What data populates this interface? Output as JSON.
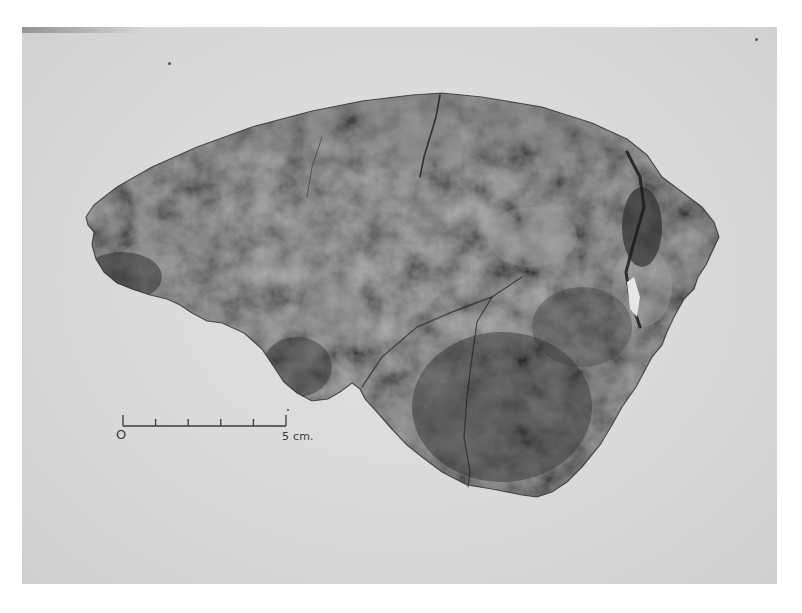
{
  "image": {
    "subject": "fossil skull fragment (calvaria) photographed on light background",
    "description": "Black-and-white photograph of a fragmentary cranial vault with a scale bar"
  },
  "scale_bar": {
    "start_label": "O",
    "end_label": "5 cm.",
    "divisions": 5,
    "units": "cm",
    "length_value": 5
  },
  "colors": {
    "background_paper": "#ffffff",
    "photo_background": "#dcdcdc",
    "specimen_dark": "#2e2e2e",
    "specimen_mid": "#585858",
    "specimen_light": "#9a9a9a",
    "scale_ink": "#3a3a3a"
  }
}
